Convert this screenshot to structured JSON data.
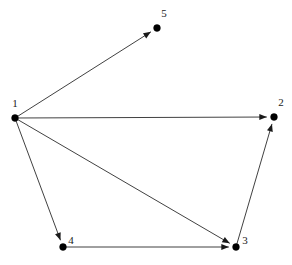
{
  "figure": {
    "background_color": "#ffffff",
    "edge_color": "#2b2b2b",
    "node_color": "#000000",
    "label_color": "#1a1a1a",
    "width": 292,
    "height": 265
  },
  "chart_data": {
    "type": "diagram",
    "diagram_type": "directed-graph",
    "title": "",
    "xlabel": "",
    "ylabel": "",
    "directed": true,
    "node_count": 5,
    "edge_count": 6,
    "nodes": [
      {
        "id": "1",
        "label": "1",
        "x": 15,
        "y": 118,
        "label_x": 15,
        "label_y": 107
      },
      {
        "id": "2",
        "label": "2",
        "x": 274,
        "y": 117,
        "label_x": 281,
        "label_y": 106
      },
      {
        "id": "3",
        "label": "3",
        "x": 236,
        "y": 247,
        "label_x": 245,
        "label_y": 244
      },
      {
        "id": "4",
        "label": "4",
        "x": 63,
        "y": 247,
        "label_x": 71,
        "label_y": 244
      },
      {
        "id": "5",
        "label": "5",
        "x": 157,
        "y": 28,
        "label_x": 164,
        "label_y": 17
      }
    ],
    "edges": [
      {
        "from": "1",
        "to": "5",
        "arrow_at": "to",
        "label": ""
      },
      {
        "from": "1",
        "to": "2",
        "arrow_at": "to",
        "label": ""
      },
      {
        "from": "1",
        "to": "3",
        "arrow_at": "to",
        "label": ""
      },
      {
        "from": "1",
        "to": "4",
        "arrow_at": "to",
        "label": ""
      },
      {
        "from": "4",
        "to": "3",
        "arrow_at": "to",
        "label": ""
      },
      {
        "from": "3",
        "to": "2",
        "arrow_at": "to",
        "label": ""
      }
    ],
    "adjacency": {
      "1": [
        "2",
        "3",
        "4",
        "5"
      ],
      "2": [],
      "3": [
        "2"
      ],
      "4": [
        "3"
      ],
      "5": []
    },
    "legend": [],
    "annotations": []
  }
}
